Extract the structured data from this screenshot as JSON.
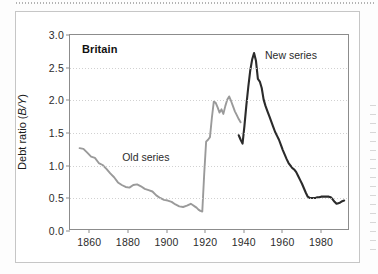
{
  "figure": {
    "panel_label": "Britain",
    "y_axis_label_main": "Debt ratio (",
    "y_axis_label_italic": "B/Y",
    "y_axis_label_close": ")",
    "annotations": {
      "old_series": "Old series",
      "new_series": "New series"
    },
    "colors": {
      "old_series": "#9a9a9a",
      "new_series": "#2b2b2b",
      "axis": "#8c8c8c",
      "grid": "#c9c9c9",
      "frame": "#c6c6c6",
      "text": "#1a1a1a"
    }
  },
  "chart_data": {
    "type": "line",
    "title": "Britain",
    "xlabel": "",
    "ylabel": "Debt ratio (B/Y)",
    "xlim": [
      1850,
      1995
    ],
    "ylim": [
      0.0,
      3.0
    ],
    "yticks": [
      0.0,
      0.5,
      1.0,
      1.5,
      2.0,
      2.5,
      3.0
    ],
    "ytick_labels": [
      "0.0",
      "0.5",
      "1.0",
      "1.5",
      "2.0",
      "2.5",
      "3.0"
    ],
    "xticks": [
      1860,
      1880,
      1900,
      1920,
      1940,
      1960,
      1980
    ],
    "xtick_labels": [
      "1860",
      "1880",
      "1900",
      "1920",
      "1940",
      "1960",
      "1980"
    ],
    "grid": true,
    "grid_axis": "y",
    "legend": "annotations-inline",
    "series": [
      {
        "name": "Old series",
        "color": "#9a9a9a",
        "x": [
          1855,
          1857,
          1859,
          1861,
          1863,
          1865,
          1867,
          1869,
          1871,
          1873,
          1875,
          1877,
          1879,
          1881,
          1883,
          1885,
          1887,
          1889,
          1891,
          1893,
          1895,
          1897,
          1899,
          1901,
          1903,
          1905,
          1907,
          1909,
          1911,
          1913,
          1914,
          1915,
          1916,
          1917,
          1918,
          1919,
          1920,
          1921,
          1922,
          1923,
          1924,
          1925,
          1926,
          1927,
          1928,
          1929,
          1930,
          1931,
          1932,
          1933,
          1934,
          1935,
          1936,
          1937,
          1938,
          1939
        ],
        "values": [
          1.25,
          1.24,
          1.18,
          1.12,
          1.1,
          1.02,
          0.99,
          0.93,
          0.86,
          0.8,
          0.72,
          0.68,
          0.65,
          0.64,
          0.68,
          0.69,
          0.66,
          0.62,
          0.6,
          0.58,
          0.52,
          0.48,
          0.45,
          0.44,
          0.42,
          0.38,
          0.35,
          0.34,
          0.36,
          0.39,
          0.37,
          0.35,
          0.33,
          0.3,
          0.28,
          0.27,
          0.85,
          1.35,
          1.38,
          1.42,
          1.72,
          1.97,
          1.95,
          1.88,
          1.8,
          1.85,
          1.78,
          1.9,
          2.0,
          2.05,
          1.98,
          1.9,
          1.82,
          1.76,
          1.7,
          1.65
        ]
      },
      {
        "name": "New series",
        "color": "#2b2b2b",
        "x": [
          1938,
          1939,
          1940,
          1941,
          1942,
          1943,
          1944,
          1945,
          1946,
          1947,
          1948,
          1949,
          1950,
          1951,
          1952,
          1953,
          1954,
          1955,
          1956,
          1957,
          1958,
          1959,
          1960,
          1961,
          1962,
          1963,
          1964,
          1965,
          1966,
          1967,
          1968,
          1969,
          1970,
          1971,
          1972,
          1973,
          1974,
          1975,
          1976,
          1977,
          1978,
          1979,
          1980,
          1981,
          1982,
          1983,
          1984,
          1985,
          1986,
          1987,
          1988,
          1989,
          1990,
          1991,
          1992,
          1993
        ],
        "values": [
          1.45,
          1.38,
          1.32,
          1.6,
          1.92,
          2.2,
          2.45,
          2.62,
          2.72,
          2.6,
          2.32,
          2.28,
          2.18,
          2.0,
          1.9,
          1.82,
          1.74,
          1.66,
          1.58,
          1.5,
          1.44,
          1.38,
          1.3,
          1.22,
          1.15,
          1.08,
          1.02,
          0.98,
          0.94,
          0.92,
          0.88,
          0.82,
          0.76,
          0.7,
          0.63,
          0.56,
          0.5,
          0.48,
          0.48,
          0.48,
          0.48,
          0.49,
          0.49,
          0.5,
          0.5,
          0.5,
          0.5,
          0.5,
          0.49,
          0.46,
          0.42,
          0.39,
          0.4,
          0.41,
          0.43,
          0.44
        ]
      }
    ],
    "notes": [
      {
        "text": "Old series",
        "x": 1877,
        "y": 1.12
      },
      {
        "text": "New series",
        "x": 1951,
        "y": 2.68
      }
    ]
  }
}
